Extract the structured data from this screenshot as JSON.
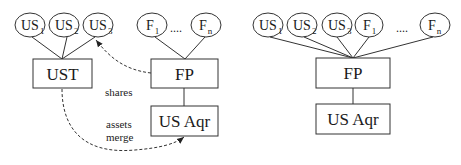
{
  "diagrams": [
    {
      "id": "before-merger",
      "ellipses": [
        {
          "main": "US",
          "sub": "1"
        },
        {
          "main": "US",
          "sub": "2"
        },
        {
          "main": "US",
          "sub": "3"
        },
        {
          "main": "F",
          "sub": "1"
        },
        {
          "main": "F",
          "sub": "n"
        }
      ],
      "ellipsis_dots": "....",
      "boxes": {
        "ust": "UST",
        "fp": "FP",
        "usaqr": "US Aqr"
      },
      "edges": {
        "shares": "shares",
        "assets_line1": "assets",
        "assets_line2": "merge"
      }
    },
    {
      "id": "after-merger",
      "ellipses": [
        {
          "main": "US",
          "sub": "1"
        },
        {
          "main": "US",
          "sub": "2"
        },
        {
          "main": "US",
          "sub": "3"
        },
        {
          "main": "F",
          "sub": "1"
        },
        {
          "main": "F",
          "sub": "n"
        }
      ],
      "ellipsis_dots": "....",
      "boxes": {
        "fp": "FP",
        "usaqr": "US Aqr"
      }
    }
  ]
}
